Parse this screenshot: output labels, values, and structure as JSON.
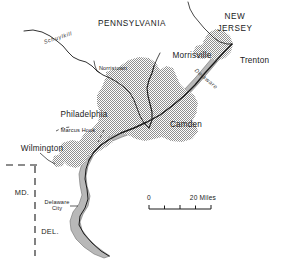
{
  "map": {
    "title": "Delaware Valley Urbanized Area Map",
    "colors": {
      "background": "#ffffff",
      "urban_fill": "#9e9e9e",
      "water_fill": "#bdbdbd",
      "line": "#1a1a1a",
      "text": "#1a1a1a",
      "river_label": "#3a3a3a"
    },
    "states": [
      {
        "id": "pennsylvania",
        "label": "PENNSYLVANIA",
        "x": 132,
        "y": 24
      },
      {
        "id": "new-jersey-line1",
        "label": "NEW",
        "x": 235,
        "y": 17
      },
      {
        "id": "new-jersey-line2",
        "label": "JERSEY",
        "x": 235,
        "y": 29
      }
    ],
    "state_abbreviations": [
      {
        "id": "maryland",
        "label": "MD.",
        "x": 22,
        "y": 193
      },
      {
        "id": "delaware",
        "label": "DEL.",
        "x": 50,
        "y": 232
      }
    ],
    "cities_major": [
      {
        "id": "philadelphia",
        "label": "Philadelphia",
        "x": 84,
        "y": 115
      },
      {
        "id": "camden",
        "label": "Camden",
        "x": 186,
        "y": 125
      },
      {
        "id": "trenton",
        "label": "Trenton",
        "x": 242,
        "y": 61
      },
      {
        "id": "morrisville",
        "label": "Morrisville",
        "x": 192,
        "y": 56
      },
      {
        "id": "wilmington",
        "label": "Wilmington",
        "x": 42,
        "y": 149
      }
    ],
    "cities_minor": [
      {
        "id": "norristown",
        "label": "Norristown",
        "x": 113,
        "y": 69
      },
      {
        "id": "marcus-hook",
        "label": "Marcus Hook",
        "x": 78,
        "y": 133
      },
      {
        "id": "delaware-city-line1",
        "label": "Delaware",
        "x": 57,
        "y": 203
      },
      {
        "id": "delaware-city-line2",
        "label": "City",
        "x": 57,
        "y": 209
      }
    ],
    "rivers": [
      {
        "id": "schuylkill",
        "label": "Schuylkill",
        "x": 58,
        "y": 38,
        "rotation": -18
      },
      {
        "id": "delaware-river",
        "label": "Delaware",
        "x": 206,
        "y": 79,
        "rotation": 40
      }
    ],
    "scale_bar": {
      "start_label": "0",
      "end_label": "20 Miles",
      "start_x": 149,
      "end_x": 211,
      "y": 209,
      "ticks": [
        149,
        164.5,
        180,
        195.5,
        211
      ],
      "unit": "Miles",
      "max_value": 20
    },
    "legend_note": "Shaded tone denotes continuously built-up urbanized area; gray ribbon denotes Delaware River and Bay; dashed line denotes state boundary."
  }
}
